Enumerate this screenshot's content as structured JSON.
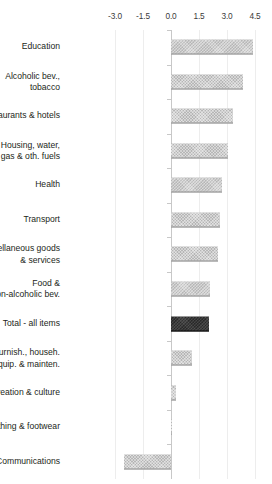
{
  "chart_data": {
    "type": "bar",
    "orientation": "horizontal",
    "title": "",
    "xlabel": "",
    "ylabel": "",
    "xlim": [
      -3.6,
      5.0
    ],
    "grid": true,
    "legend": null,
    "ticks": [
      "-3.0",
      "-1.5",
      "0.0",
      "1.5",
      "3.0",
      "4.5"
    ],
    "tick_values": [
      -3.0,
      -1.5,
      0.0,
      1.5,
      3.0,
      4.5
    ],
    "axis_position": "top",
    "categories": [
      "Education",
      "Alcoholic bev.,\ntobacco",
      "Restaurants & hotels",
      "Housing, water,\nelec., gas & oth. fuels",
      "Health",
      "Transport",
      "Miscellaneous goods\n& services",
      "Food &\nnon-alcoholic bev.",
      "Total - all items",
      "Furnish., househ.\nequip. & mainten.",
      "Recreation & culture",
      "Clothing & footwear",
      "Communications"
    ],
    "values": [
      4.4,
      3.85,
      3.3,
      3.05,
      2.75,
      2.6,
      2.5,
      2.1,
      2.05,
      1.1,
      0.25,
      0.05,
      -2.5
    ],
    "highlight_index": 8,
    "colors": {
      "bar": "#b6b6b6",
      "bar_highlight": "#282828",
      "gridline": "#ededed",
      "axis": "#c8c8c8",
      "text": "#231f20"
    }
  }
}
